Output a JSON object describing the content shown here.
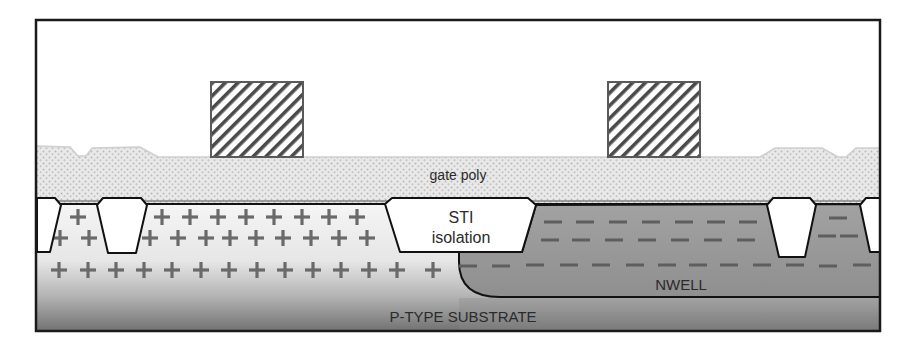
{
  "diagram": {
    "frame": {
      "x": 36,
      "y": 20,
      "width": 844,
      "height": 311
    },
    "colors": {
      "frame": "#1a1a1a",
      "poly_fill": "#e6e6e6",
      "poly_dots": "#b4b4b4",
      "poly_edge": "#cfcfcf",
      "gate_stroke": "#5a5a5a",
      "gate_hatch": "#4a4a4a",
      "pwell_light": "#f4f4f4",
      "substrate_dark": "#6e6e6e",
      "nwell_fill": "#9a9a9a",
      "sti_fill": "#ffffff",
      "outline": "#111111",
      "marker": "#6a6a6a"
    },
    "labels": {
      "gate_poly": "gate poly",
      "sti_line1": "STI",
      "sti_line2": "isolation",
      "nwell": "NWELL",
      "substrate": "P-TYPE SUBSTRATE"
    },
    "label_positions": {
      "gate_poly": {
        "x": 458,
        "y": 180
      },
      "sti_line1": {
        "x": 461,
        "y": 223
      },
      "sti_line2": {
        "x": 461,
        "y": 243
      },
      "nwell": {
        "x": 681,
        "y": 290
      },
      "substrate": {
        "x": 463,
        "y": 322
      }
    },
    "gates": [
      {
        "name": "gate-left",
        "x": 211,
        "y": 82,
        "width": 92,
        "height": 75
      },
      {
        "name": "gate-right",
        "x": 608,
        "y": 82,
        "width": 92,
        "height": 75
      }
    ],
    "poly_top_path": "M36,146 L70,147 L78,156 L86,156 L92,148 L140,147 L158,157 L760,157 L775,148 L822,148 L838,157 L846,157 L856,148 L880,148",
    "silicon_surface_y": 204,
    "sti_blocks": [
      {
        "name": "sti-edge-left",
        "points": "37,198 55,198 61,205 50,252 37,252"
      },
      {
        "name": "sti-small-left",
        "points": "97,205 103,198 141,198 147,205 136,253 108,253"
      },
      {
        "name": "sti-center",
        "points": "385,204 392,198 528,198 536,205 522,252 400,252"
      },
      {
        "name": "sti-small-right",
        "points": "767,205 773,198 810,198 816,205 805,257 779,257"
      },
      {
        "name": "sti-edge-right",
        "points": "860,205 866,198 880,198 880,252 870,252"
      }
    ],
    "nwell_path": "M880,204 L536,205 L522,252 L459,252 L459,262 Q459,297 500,297 L880,297 Z",
    "plus_markers": [
      [
        78,
        217
      ],
      [
        162,
        217
      ],
      [
        190,
        217
      ],
      [
        218,
        217
      ],
      [
        246,
        217
      ],
      [
        274,
        217
      ],
      [
        302,
        217
      ],
      [
        329,
        217
      ],
      [
        357,
        217
      ],
      [
        60,
        238
      ],
      [
        89,
        238
      ],
      [
        150,
        238
      ],
      [
        178,
        238
      ],
      [
        206,
        238
      ],
      [
        230,
        238
      ],
      [
        256,
        238
      ],
      [
        283,
        238
      ],
      [
        311,
        238
      ],
      [
        339,
        238
      ],
      [
        367,
        238
      ],
      [
        59,
        270
      ],
      [
        88,
        270
      ],
      [
        116,
        270
      ],
      [
        144,
        270
      ],
      [
        172,
        270
      ],
      [
        201,
        270
      ],
      [
        229,
        270
      ],
      [
        257,
        270
      ],
      [
        285,
        270
      ],
      [
        313,
        270
      ],
      [
        341,
        270
      ],
      [
        369,
        270
      ],
      [
        397,
        270
      ],
      [
        433,
        270
      ]
    ],
    "minus_markers": [
      [
        553,
        222
      ],
      [
        585,
        222
      ],
      [
        618,
        222
      ],
      [
        651,
        222
      ],
      [
        684,
        222
      ],
      [
        716,
        222
      ],
      [
        748,
        222
      ],
      [
        838,
        218
      ],
      [
        550,
        240
      ],
      [
        581,
        240
      ],
      [
        614,
        240
      ],
      [
        647,
        240
      ],
      [
        680,
        240
      ],
      [
        713,
        240
      ],
      [
        746,
        240
      ],
      [
        827,
        236
      ],
      [
        849,
        236
      ],
      [
        468,
        266
      ],
      [
        501,
        266
      ],
      [
        535,
        265
      ],
      [
        569,
        265
      ],
      [
        601,
        265
      ],
      [
        635,
        265
      ],
      [
        667,
        265
      ],
      [
        698,
        265
      ],
      [
        729,
        265
      ],
      [
        762,
        265
      ],
      [
        795,
        265
      ],
      [
        828,
        266
      ],
      [
        862,
        265
      ]
    ]
  }
}
